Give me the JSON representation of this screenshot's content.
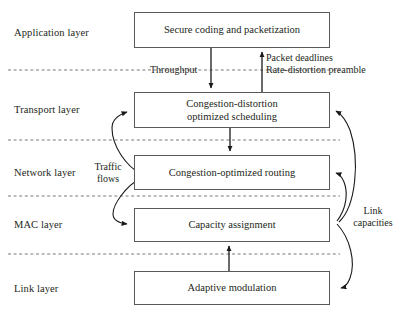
{
  "figure": {
    "type": "layered-protocol-stack-diagram"
  },
  "layers": [
    {
      "id": "application",
      "label": "Application layer"
    },
    {
      "id": "transport",
      "label": "Transport layer"
    },
    {
      "id": "network",
      "label": "Network layer"
    },
    {
      "id": "mac",
      "label": "MAC layer"
    },
    {
      "id": "link",
      "label": "Link layer"
    }
  ],
  "boxes": [
    {
      "id": "application-box",
      "line1": "Secure coding and packetization",
      "line2": ""
    },
    {
      "id": "transport-box",
      "line1": "Congestion-distortion",
      "line2": "optimized scheduling"
    },
    {
      "id": "network-box",
      "line1": "Congestion-optimized routing",
      "line2": ""
    },
    {
      "id": "mac-box",
      "line1": "Capacity assignment",
      "line2": ""
    },
    {
      "id": "link-box",
      "line1": "Adaptive modulation",
      "line2": ""
    }
  ],
  "annotations": [
    {
      "id": "throughput",
      "line1": "Throughput",
      "line2": ""
    },
    {
      "id": "packet-feedback",
      "line1": "Packet deadlines",
      "line2": "Rate-distortion preamble"
    },
    {
      "id": "traffic-flows",
      "line1": "Traffic",
      "line2": "flows"
    },
    {
      "id": "link-capacities",
      "line1": "Link",
      "line2": "capacities"
    }
  ],
  "colors": {
    "box_border": "#5a5a5a",
    "text": "#231f20",
    "arrow": "#1a1a1a",
    "divider": "#7a7a7a",
    "background": "#ffffff"
  },
  "dividers": [
    {
      "id": "app-transport-divider",
      "y": 70
    },
    {
      "id": "transport-network-divider",
      "y": 140
    },
    {
      "id": "network-mac-divider",
      "y": 196
    },
    {
      "id": "mac-link-divider",
      "y": 254
    }
  ]
}
